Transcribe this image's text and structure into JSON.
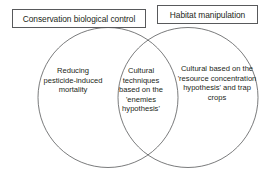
{
  "diagram": {
    "type": "venn",
    "title": "",
    "labels": {
      "left_box": "Conservation biological control",
      "right_box": "Habitat manipulation"
    },
    "regions": {
      "left_only": "Reducing pesticide-induced mortality",
      "intersection": "Cultural techniques based on the 'enemies hypothesis'",
      "right_only": "Cultural based on the 'resource concentration hypothesis' and trap crops"
    },
    "colors": {
      "stroke": "#58595b",
      "text": "#231f20",
      "background": "#ffffff"
    }
  }
}
